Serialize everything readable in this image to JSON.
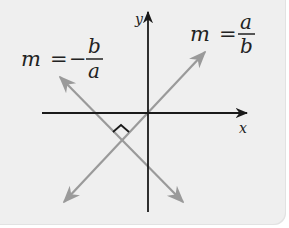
{
  "diagram": {
    "axes": {
      "x_label": "x",
      "y_label": "y"
    },
    "lines": [
      {
        "label_var": "m",
        "label_eq": "=",
        "label_sign": "",
        "label_num": "a",
        "label_den": "b",
        "description": "line with slope a/b"
      },
      {
        "label_var": "m",
        "label_eq": "=",
        "label_sign": "−",
        "label_num": "b",
        "label_den": "a",
        "description": "line with slope -b/a"
      }
    ],
    "right_angle_marker": true,
    "colors": {
      "axis": "#1a1a1a",
      "line": "#9a9a9a",
      "background": "#efefef",
      "text": "#222222"
    }
  }
}
